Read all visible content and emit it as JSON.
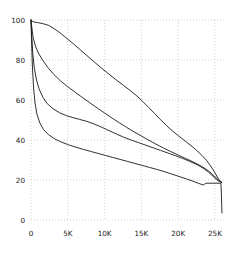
{
  "chart_data": {
    "type": "line",
    "title": "",
    "subtitle": "",
    "xlabel": "",
    "ylabel": "",
    "xlim": [
      0,
      26500
    ],
    "ylim": [
      0,
      100
    ],
    "grid": true,
    "grid_style": "dotted",
    "legend": null,
    "legend_position": "none",
    "x_ticks": [
      0,
      5000,
      10000,
      15000,
      20000,
      25000
    ],
    "x_tick_labels": [
      "0",
      "5K",
      "10K",
      "15K",
      "20K",
      "25K"
    ],
    "y_ticks": [
      0,
      20,
      40,
      60,
      80,
      100
    ],
    "y_tick_labels": [
      "0",
      "20",
      "40",
      "60",
      "80",
      "100"
    ],
    "line_color": "#1a1a1a",
    "grid_color": "#bdbdbd",
    "background_color": "#ffffff",
    "series": [
      {
        "name": "curve-1",
        "color": "#1a1a1a",
        "points": [
          [
            0,
            100
          ],
          [
            150,
            99.4
          ],
          [
            400,
            99.0
          ],
          [
            900,
            98.7
          ],
          [
            1600,
            98.2
          ],
          [
            2400,
            97.3
          ],
          [
            3000,
            96.0
          ],
          [
            3800,
            94.0
          ],
          [
            4600,
            91.6
          ],
          [
            5600,
            88.6
          ],
          [
            6600,
            85.4
          ],
          [
            7600,
            82.2
          ],
          [
            8600,
            79.0
          ],
          [
            9600,
            75.9
          ],
          [
            10600,
            72.9
          ],
          [
            11600,
            70.0
          ],
          [
            12600,
            67.2
          ],
          [
            13600,
            64.4
          ],
          [
            14400,
            62.0
          ],
          [
            15200,
            59.2
          ],
          [
            16000,
            56.2
          ],
          [
            16800,
            53.2
          ],
          [
            17600,
            50.2
          ],
          [
            18400,
            47.3
          ],
          [
            19200,
            44.6
          ],
          [
            20000,
            42.2
          ],
          [
            20800,
            39.9
          ],
          [
            21600,
            37.6
          ],
          [
            22400,
            35.2
          ],
          [
            23200,
            32.4
          ],
          [
            23900,
            29.6
          ],
          [
            24500,
            26.6
          ],
          [
            25000,
            23.6
          ],
          [
            25400,
            21.0
          ],
          [
            25700,
            19.4
          ],
          [
            25900,
            18.8
          ]
        ]
      },
      {
        "name": "curve-2",
        "color": "#1a1a1a",
        "points": [
          [
            0,
            100
          ],
          [
            120,
            96.0
          ],
          [
            300,
            91.0
          ],
          [
            600,
            87.0
          ],
          [
            1000,
            83.5
          ],
          [
            1600,
            79.8
          ],
          [
            2300,
            76.2
          ],
          [
            3100,
            72.8
          ],
          [
            4000,
            69.6
          ],
          [
            5000,
            66.6
          ],
          [
            6000,
            63.9
          ],
          [
            7000,
            61.2
          ],
          [
            8000,
            58.6
          ],
          [
            9000,
            56.0
          ],
          [
            10000,
            53.5
          ],
          [
            11000,
            51.0
          ],
          [
            12000,
            48.6
          ],
          [
            13000,
            46.3
          ],
          [
            14000,
            44.1
          ],
          [
            15000,
            42.0
          ],
          [
            16000,
            39.9
          ],
          [
            17000,
            37.9
          ],
          [
            18000,
            36.0
          ],
          [
            19000,
            34.2
          ],
          [
            20000,
            32.5
          ],
          [
            21000,
            30.8
          ],
          [
            22000,
            29.1
          ],
          [
            23000,
            27.2
          ],
          [
            23800,
            25.4
          ],
          [
            24500,
            23.4
          ],
          [
            25100,
            21.3
          ],
          [
            25500,
            19.9
          ],
          [
            25800,
            19.1
          ],
          [
            25950,
            18.8
          ]
        ]
      },
      {
        "name": "curve-3",
        "color": "#1a1a1a",
        "points": [
          [
            0,
            100
          ],
          [
            100,
            92.0
          ],
          [
            250,
            83.0
          ],
          [
            450,
            76.0
          ],
          [
            750,
            70.0
          ],
          [
            1100,
            65.5
          ],
          [
            1600,
            61.5
          ],
          [
            2200,
            58.2
          ],
          [
            3000,
            55.6
          ],
          [
            3900,
            53.6
          ],
          [
            4800,
            52.2
          ],
          [
            5700,
            51.2
          ],
          [
            6600,
            50.3
          ],
          [
            7600,
            49.3
          ],
          [
            8600,
            48.0
          ],
          [
            9600,
            46.4
          ],
          [
            10600,
            44.7
          ],
          [
            11600,
            43.0
          ],
          [
            12600,
            41.4
          ],
          [
            13600,
            40.0
          ],
          [
            14600,
            38.7
          ],
          [
            15600,
            37.4
          ],
          [
            16600,
            36.1
          ],
          [
            17600,
            34.8
          ],
          [
            18600,
            33.5
          ],
          [
            19600,
            32.2
          ],
          [
            20600,
            30.8
          ],
          [
            21600,
            29.3
          ],
          [
            22600,
            27.6
          ],
          [
            23400,
            25.9
          ],
          [
            24100,
            24.0
          ],
          [
            24700,
            22.0
          ],
          [
            25200,
            20.2
          ],
          [
            25600,
            19.2
          ],
          [
            25900,
            18.8
          ]
        ]
      },
      {
        "name": "curve-4",
        "color": "#1a1a1a",
        "points": [
          [
            0,
            100
          ],
          [
            90,
            88.0
          ],
          [
            200,
            76.0
          ],
          [
            350,
            66.0
          ],
          [
            550,
            58.5
          ],
          [
            800,
            53.0
          ],
          [
            1200,
            48.5
          ],
          [
            1700,
            45.2
          ],
          [
            2400,
            42.6
          ],
          [
            3200,
            40.6
          ],
          [
            4100,
            39.0
          ],
          [
            5100,
            37.6
          ],
          [
            6100,
            36.4
          ],
          [
            7100,
            35.3
          ],
          [
            8100,
            34.3
          ],
          [
            9100,
            33.3
          ],
          [
            10100,
            32.3
          ],
          [
            11100,
            31.3
          ],
          [
            12100,
            30.3
          ],
          [
            13100,
            29.3
          ],
          [
            14100,
            28.3
          ],
          [
            15100,
            27.3
          ],
          [
            16100,
            26.3
          ],
          [
            17100,
            25.3
          ],
          [
            18100,
            24.2
          ],
          [
            19100,
            23.0
          ],
          [
            20100,
            21.8
          ],
          [
            21100,
            20.6
          ],
          [
            22000,
            19.4
          ],
          [
            22800,
            18.3
          ],
          [
            23400,
            17.5
          ],
          [
            23700,
            18.2
          ],
          [
            23750,
            18.4
          ],
          [
            25800,
            18.4
          ],
          [
            25850,
            15.0
          ],
          [
            25900,
            10.0
          ],
          [
            25950,
            3.5
          ]
        ]
      }
    ]
  },
  "axes": {
    "x_axis_name": "x-axis",
    "y_axis_name": "y-axis"
  }
}
